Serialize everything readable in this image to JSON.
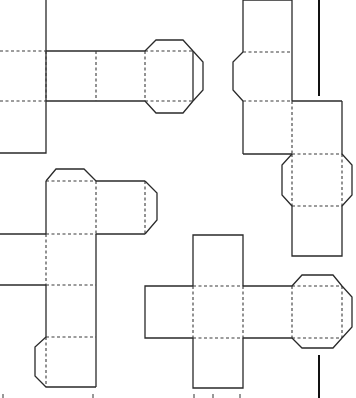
{
  "figure": {
    "colors": {
      "line": "#2a2a2a",
      "fold": "#3a3a3a",
      "background": "#ffffff"
    }
  },
  "nets": [
    {
      "id": "net-top-left",
      "faces": 6,
      "tabs": 4
    },
    {
      "id": "net-top-right",
      "faces": 6,
      "tabs": 3
    },
    {
      "id": "net-bottom-left",
      "faces": 6,
      "tabs": 3
    },
    {
      "id": "net-bottom-right",
      "faces": 6,
      "tabs": 3
    }
  ]
}
